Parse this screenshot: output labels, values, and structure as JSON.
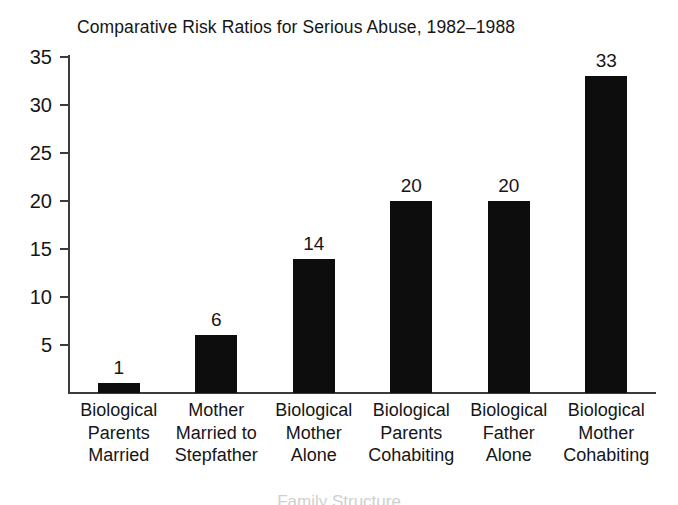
{
  "chart_data": {
    "type": "bar",
    "title": "Comparative Risk Ratios for Serious Abuse, 1982–1988",
    "xlabel": "Family Structure",
    "ylabel": "",
    "categories": [
      "Biological Parents Married",
      "Mother Married to Stepfather",
      "Biological Mother Alone",
      "Biological Parents Cohabiting",
      "Biological Father Alone",
      "Biological Mother Cohabiting"
    ],
    "category_lines": [
      [
        "Biological",
        "Parents",
        "Married"
      ],
      [
        "Mother",
        "Married to",
        "Stepfather"
      ],
      [
        "Biological",
        "Mother",
        "Alone"
      ],
      [
        "Biological",
        "Parents",
        "Cohabiting"
      ],
      [
        "Biological",
        "Father",
        "Alone"
      ],
      [
        "Biological",
        "Mother",
        "Cohabiting"
      ]
    ],
    "values": [
      1,
      6,
      14,
      20,
      20,
      33
    ],
    "value_labels": [
      "1",
      "6",
      "14",
      "20",
      "20",
      "33"
    ],
    "ylim": [
      0,
      35
    ],
    "yticks": [
      5,
      10,
      15,
      20,
      25,
      30,
      35
    ],
    "ytick_labels": [
      "5",
      "10",
      "15",
      "20",
      "25",
      "30",
      "35"
    ],
    "grid": false,
    "legend": false,
    "bar_color": "#0d0d0d",
    "axis_color": "#3b3b3b",
    "background": "#ffffff"
  }
}
